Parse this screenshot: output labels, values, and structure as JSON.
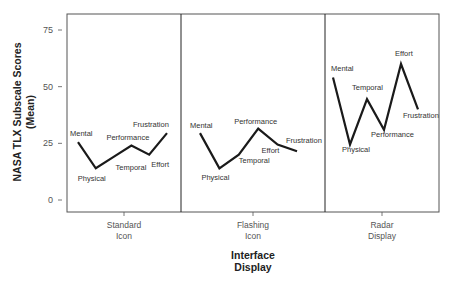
{
  "chart_data": {
    "type": "line",
    "title": "",
    "xlabel": "Interface Display",
    "xlabel_lines": [
      "Interface",
      "Display"
    ],
    "ylabel": "NASA TLX Subscale Scores (Mean)",
    "ylabel_lines": [
      "NASA TLX Subscale Scores",
      "(Mean)"
    ],
    "ylim": [
      -5,
      82
    ],
    "yticks": [
      0,
      25,
      50,
      75
    ],
    "grid": false,
    "legend": null,
    "facets": [
      "Standard Icon",
      "Flashing Icon",
      "Radar Display"
    ],
    "facet_label_lines": [
      [
        "Standard",
        "Icon"
      ],
      [
        "Flashing",
        "Icon"
      ],
      [
        "Radar",
        "Display"
      ]
    ],
    "subscales": [
      "Mental",
      "Physical",
      "Temporal",
      "Performance",
      "Effort",
      "Frustration"
    ],
    "series": [
      {
        "name": "Standard Icon",
        "values": [
          25.5,
          14,
          19,
          24,
          20,
          29.5
        ]
      },
      {
        "name": "Flashing Icon",
        "values": [
          29.5,
          14,
          20,
          31.5,
          24.5,
          21.5
        ]
      },
      {
        "name": "Radar Display",
        "values": [
          54,
          24.5,
          44.5,
          31,
          60,
          40
        ]
      }
    ],
    "label_offsets": [
      [
        [
          -8,
          -6,
          "start"
        ],
        [
          -18,
          13,
          "start"
        ],
        [
          2,
          13,
          "start"
        ],
        [
          -25,
          -6,
          "start"
        ],
        [
          2,
          12,
          "start"
        ],
        [
          -34,
          -6,
          "start"
        ]
      ],
      [
        [
          -10,
          -5,
          "start"
        ],
        [
          -18,
          12,
          "start"
        ],
        [
          0,
          8,
          "start"
        ],
        [
          -24,
          -5,
          "start"
        ],
        [
          -16,
          9,
          "start"
        ],
        [
          -11,
          -8,
          "start"
        ]
      ],
      [
        [
          -2,
          -7,
          "start"
        ],
        [
          -8,
          8,
          "start"
        ],
        [
          -15,
          -9,
          "start"
        ],
        [
          -13,
          7,
          "start"
        ],
        [
          -6,
          -8,
          "start"
        ],
        [
          -15,
          9,
          "start"
        ]
      ]
    ]
  },
  "colors": {
    "line": "#1a1a1a",
    "frame": "#555555",
    "text": "#444444"
  }
}
